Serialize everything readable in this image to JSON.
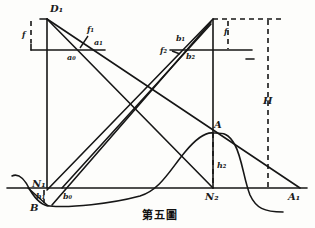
{
  "figure": {
    "caption": "第五圖",
    "ink_color": "#161616",
    "paper_color": "#fdfdfb"
  },
  "labels": {
    "D1": "D₁",
    "f_left": "f",
    "f1": "f₁",
    "a0": "a₀",
    "a1": "a₁",
    "b1": "b₁",
    "b2": "b₂",
    "f2": "f₂",
    "f_right": "f",
    "H": "H",
    "A": "A",
    "h2": "h₂",
    "N1": "N₁",
    "h1": "h₁",
    "b0": "b₀",
    "B": "B",
    "N2": "N₂",
    "A1": "A₁"
  }
}
